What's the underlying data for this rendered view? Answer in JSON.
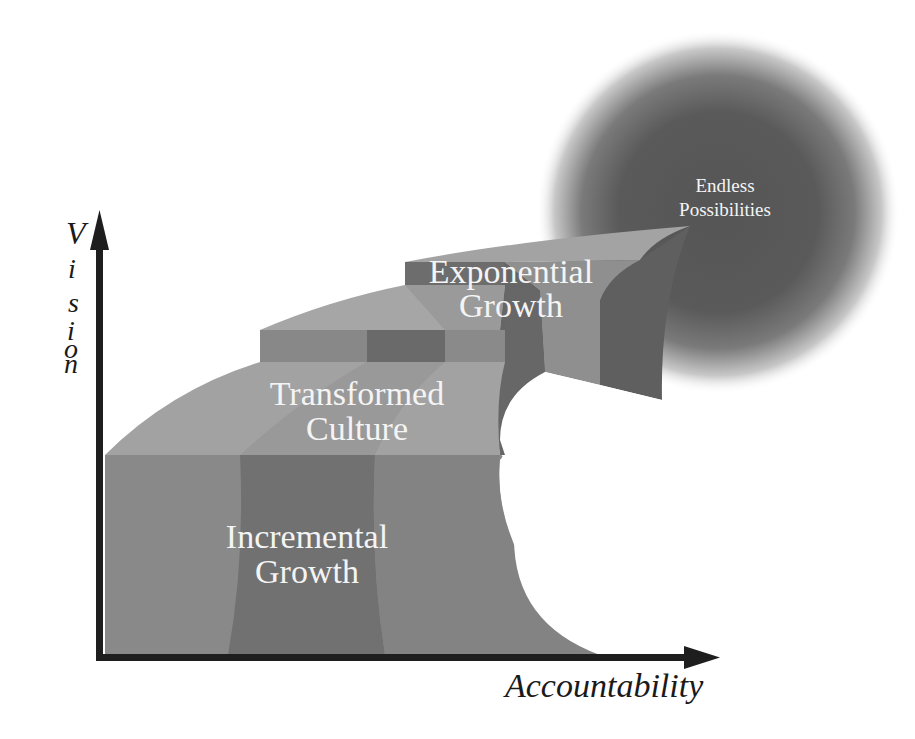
{
  "diagram": {
    "type": "staircase-growth-diagram",
    "axes": {
      "y_label": "Vision",
      "y_label_letters": [
        "V",
        ".",
        "i",
        ".",
        "s",
        ".",
        "i",
        "o",
        "n"
      ],
      "x_label": "Accountability"
    },
    "steps": [
      {
        "level": 1,
        "label_line1": "Incremental",
        "label_line2": "Growth"
      },
      {
        "level": 2,
        "label_line1": "Transformed",
        "label_line2": "Culture"
      },
      {
        "level": 3,
        "label_line1": "Exponential",
        "label_line2": "Growth"
      }
    ],
    "goal": {
      "label_line1": "Endless",
      "label_line2": "Possibilities"
    },
    "colors": {
      "background": "#ffffff",
      "axis": "#1e1e1e",
      "front_light": "#8a8a8a",
      "front_dark": "#6f6f6f",
      "top_light": "#a6a6a6",
      "top_mid": "#999999",
      "side_dark": "#666666",
      "glow_core": "#555555",
      "label_text": "#f4f4f4"
    }
  }
}
